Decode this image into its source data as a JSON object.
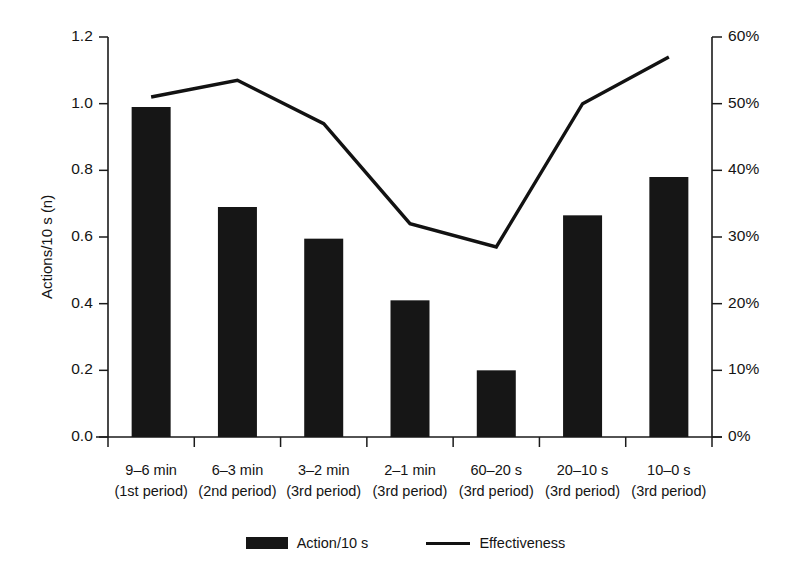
{
  "chart_data": {
    "type": "bar",
    "title": "",
    "subtitle": "",
    "categories": [
      "9–6 min",
      "6–3 min",
      "3–2 min",
      "2–1 min",
      "60–20 s",
      "20–10 s",
      "10–0 s"
    ],
    "category_sublabels": [
      "(1st period)",
      "(2nd period)",
      "(3rd period)",
      "(3rd period)",
      "(3rd period)",
      "(3rd period)",
      "(3rd period)"
    ],
    "series": [
      {
        "name": "Action/10 s",
        "type": "bar",
        "axis": "left",
        "color": "#161616",
        "values": [
          0.99,
          0.69,
          0.595,
          0.41,
          0.2,
          0.665,
          0.78
        ]
      },
      {
        "name": "Effectiveness",
        "type": "line",
        "axis": "right",
        "color": "#121212",
        "values": [
          51,
          53.5,
          47,
          32,
          28.5,
          50,
          57
        ]
      }
    ],
    "xlabel": "",
    "ylabel": "Actions/10 s (n)",
    "ylabel_right": "",
    "ylim": [
      0,
      1.2
    ],
    "ylim_right": [
      0,
      60
    ],
    "yticks": [
      "0.0",
      "0.2",
      "0.4",
      "0.6",
      "0.8",
      "1.0",
      "1.2"
    ],
    "ytick_values": [
      0.0,
      0.2,
      0.4,
      0.6,
      0.8,
      1.0,
      1.2
    ],
    "yticks_right": [
      "0%",
      "10%",
      "20%",
      "30%",
      "40%",
      "50%",
      "60%"
    ],
    "ytick_values_right": [
      0,
      10,
      20,
      30,
      40,
      50,
      60
    ],
    "grid": false,
    "legend_position": "bottom",
    "legend": [
      "Action/10 s",
      "Effectiveness"
    ]
  },
  "legend": {
    "items": [
      {
        "label": "Action/10 s",
        "marker": "bar-swatch-icon"
      },
      {
        "label": "Effectiveness",
        "marker": "line-swatch-icon"
      }
    ]
  }
}
